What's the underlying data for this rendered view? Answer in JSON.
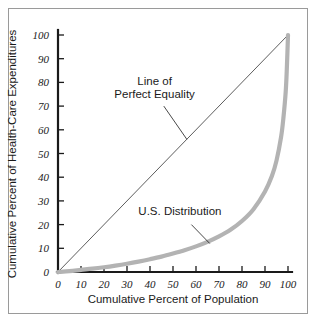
{
  "chart_data": {
    "type": "line",
    "title": "",
    "xlabel": "Cumulative Percent of Population",
    "ylabel": "Cumulative Percent of Health-Care Expenditures",
    "xlim": [
      0,
      100
    ],
    "ylim": [
      0,
      100
    ],
    "grid": false,
    "legend_position": "none",
    "xticks": [
      "0",
      "10",
      "20",
      "30",
      "40",
      "50",
      "60",
      "70",
      "80",
      "90",
      "100"
    ],
    "yticks": [
      "0",
      "10",
      "20",
      "30",
      "40",
      "50",
      "60",
      "70",
      "80",
      "90",
      "100"
    ],
    "xtick_values": [
      0,
      10,
      20,
      30,
      40,
      50,
      60,
      70,
      80,
      90,
      100
    ],
    "ytick_values": [
      0,
      10,
      20,
      30,
      40,
      50,
      60,
      70,
      80,
      90,
      100
    ],
    "series": [
      {
        "name": "Line of Perfect Equality",
        "style": "thin-black-diagonal",
        "color": "#333333",
        "width": 0.8,
        "x": [
          0,
          100
        ],
        "values": [
          0,
          100
        ]
      },
      {
        "name": "U.S. Distribution",
        "style": "thick-gray-lorenz",
        "color": "#b3b3b3",
        "width": 4.2,
        "x": [
          0,
          5,
          10,
          15,
          20,
          25,
          30,
          35,
          40,
          45,
          50,
          55,
          60,
          65,
          70,
          75,
          80,
          85,
          90,
          93,
          95,
          97,
          98,
          99,
          99.5,
          100
        ],
        "values": [
          0,
          0.4,
          0.9,
          1.4,
          2.0,
          2.7,
          3.5,
          4.4,
          5.4,
          6.5,
          7.8,
          9.2,
          10.8,
          12.7,
          15.0,
          17.8,
          21.5,
          26.5,
          34.0,
          40.5,
          47.0,
          57.0,
          65.0,
          76.0,
          86.0,
          100
        ]
      }
    ],
    "annotations": [
      {
        "name": "line-of-perfect-equality",
        "text_line1": "Line of",
        "text_line2": "Perfect Equality",
        "text_x": 42,
        "text_y": 79,
        "leader_from_x": 46,
        "leader_from_y": 70,
        "leader_to_x": 56,
        "leader_to_y": 56
      },
      {
        "name": "us-distribution",
        "text_line1": "U.S. Distribution",
        "text_line2": "",
        "text_x": 53,
        "text_y": 24,
        "leader_from_x": 58,
        "leader_from_y": 20,
        "leader_to_x": 66,
        "leader_to_y": 12
      }
    ]
  },
  "colors": {
    "axis": "#1a1a1a",
    "equality_line": "#333333",
    "lorenz_curve": "#b3b3b3",
    "frame_border": "#9a9a9a",
    "background": "#ffffff",
    "text": "#1a1a1a"
  }
}
